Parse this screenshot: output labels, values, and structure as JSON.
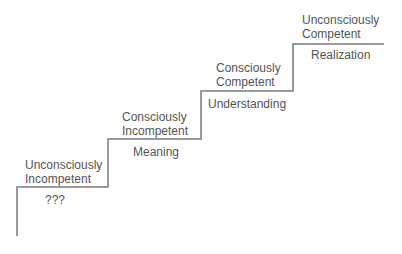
{
  "diagram": {
    "type": "staircase",
    "line_color": "#9a9a9a",
    "steps": [
      {
        "stage": "Unconsciously Incompetent",
        "stage_lines": [
          "Unconsciously",
          "Incompetent"
        ],
        "below": "???"
      },
      {
        "stage": "Consciously Incompetent",
        "stage_lines": [
          "Consciously",
          "Incompetent"
        ],
        "below": "Meaning"
      },
      {
        "stage": "Consciously Competent",
        "stage_lines": [
          "Consciously",
          "Competent"
        ],
        "below": "Understanding"
      },
      {
        "stage": "Unconsciously Competent",
        "stage_lines": [
          "Unconsciously",
          "Competent"
        ],
        "below": "Realization"
      }
    ]
  }
}
